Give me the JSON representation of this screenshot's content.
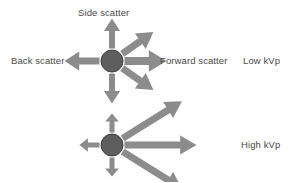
{
  "figure": {
    "title_present": false,
    "background_color": "#fefefe",
    "text_color": "#4a4a4a",
    "arrow_color": "#8c8c8c",
    "circle_fill": "#5e5e5e",
    "circle_stroke": "#3d3d3d"
  },
  "labels": {
    "side_scatter": "Side scatter",
    "back_scatter": "Back scatter",
    "forward_scatter": "Forward scatter",
    "low_kvp": "Low kVp",
    "high_kvp": "High kVp"
  },
  "diagrams": [
    {
      "name": "low-kvp-scatter",
      "condition": "Low kVp",
      "center": {
        "x": 112,
        "y": 61
      },
      "circle_radius": 11,
      "arrows": [
        {
          "name": "up-arrow",
          "direction": "up",
          "angle_deg": 90,
          "length": 30,
          "thickness": 6
        },
        {
          "name": "down-arrow",
          "direction": "down",
          "angle_deg": 270,
          "length": 30,
          "thickness": 6
        },
        {
          "name": "left-arrow",
          "direction": "left",
          "angle_deg": 180,
          "length": 35,
          "thickness": 7
        },
        {
          "name": "right-arrow",
          "direction": "right",
          "angle_deg": 0,
          "length": 42,
          "thickness": 8
        },
        {
          "name": "upper-right-arrow",
          "direction": "upper-right",
          "angle_deg": 35,
          "length": 38,
          "thickness": 7
        },
        {
          "name": "lower-right-arrow",
          "direction": "lower-right",
          "angle_deg": -35,
          "length": 38,
          "thickness": 7
        }
      ]
    },
    {
      "name": "high-kvp-scatter",
      "condition": "High kVp",
      "center": {
        "x": 112,
        "y": 145
      },
      "circle_radius": 11,
      "arrows": [
        {
          "name": "up-arrow",
          "direction": "up",
          "angle_deg": 90,
          "length": 19,
          "thickness": 5
        },
        {
          "name": "down-arrow",
          "direction": "down",
          "angle_deg": 270,
          "length": 19,
          "thickness": 5
        },
        {
          "name": "left-arrow",
          "direction": "left",
          "angle_deg": 180,
          "length": 20,
          "thickness": 5
        },
        {
          "name": "right-arrow",
          "direction": "right",
          "angle_deg": 0,
          "length": 72,
          "thickness": 7
        },
        {
          "name": "upper-right-arrow",
          "direction": "upper-right",
          "angle_deg": 32,
          "length": 70,
          "thickness": 7
        },
        {
          "name": "lower-right-arrow",
          "direction": "lower-right",
          "angle_deg": -32,
          "length": 70,
          "thickness": 7
        }
      ]
    }
  ]
}
